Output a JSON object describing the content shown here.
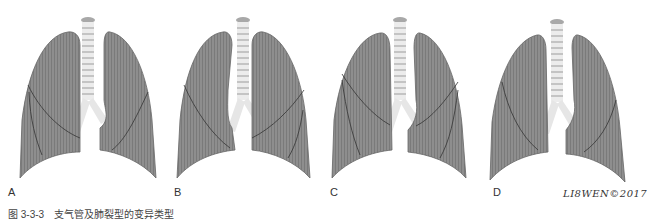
{
  "figure": {
    "caption": "图 3-3-3　支气管及肺裂型的变异类型",
    "signature": "LI8WEN©2017",
    "colors": {
      "lung": "#8a8a8a",
      "lung_edge": "#5c5c5c",
      "fissure": "#3a3a3a",
      "trachea": "#d6d6d6"
    },
    "panels": [
      {
        "label": "A",
        "x": 0
      },
      {
        "label": "B",
        "x": 160
      },
      {
        "label": "C",
        "x": 320
      },
      {
        "label": "D",
        "x": 480
      }
    ]
  }
}
